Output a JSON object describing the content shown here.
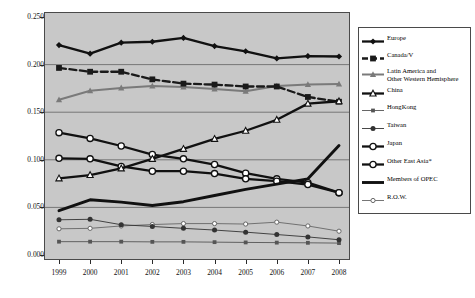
{
  "chart_data": {
    "type": "line",
    "title": "",
    "xlabel": "",
    "ylabel": "",
    "x": [
      1999,
      2000,
      2001,
      2002,
      2003,
      2004,
      2005,
      2006,
      2007,
      2008
    ],
    "xtick_labels": [
      "1999",
      "2000",
      "2001",
      "2002",
      "2003",
      "2004",
      "2005",
      "2006",
      "2007",
      "2008"
    ],
    "ytick_labels": [
      "0.250",
      "0.200",
      "0.150",
      "0.100",
      "0.050",
      "0.000"
    ],
    "ytick_values": [
      0.25,
      0.2,
      0.15,
      0.1,
      0.05,
      0.0
    ],
    "ylim": [
      0.0,
      0.25
    ],
    "xlim": [
      1999,
      2008
    ],
    "grid": "horizontal",
    "legend_position": "right",
    "plot_background": "#c8c8c8",
    "series": [
      {
        "name": "Europe",
        "marker": "diamond",
        "color": "#111111",
        "style": "solid",
        "values": [
          0.2205,
          0.2115,
          0.223,
          0.224,
          0.228,
          0.2195,
          0.214,
          0.2065,
          0.209,
          0.2085
        ]
      },
      {
        "name": "Canada/V",
        "marker": "square",
        "color": "#1a1a1a",
        "style": "dashed",
        "values": [
          0.1965,
          0.1925,
          0.1925,
          0.1845,
          0.18,
          0.179,
          0.177,
          0.177,
          0.166,
          0.161
        ]
      },
      {
        "name": "Latin America and\nOther Western Hemisphere",
        "marker": "triangle",
        "color": "#7a7a7a",
        "style": "solid",
        "values": [
          0.163,
          0.1725,
          0.1755,
          0.1775,
          0.1765,
          0.1745,
          0.172,
          0.1775,
          0.179,
          0.1795
        ]
      },
      {
        "name": "China",
        "marker": "triangle-open",
        "color": "#111111",
        "style": "solid",
        "values": [
          0.0805,
          0.084,
          0.091,
          0.101,
          0.1115,
          0.122,
          0.1305,
          0.142,
          0.159,
          0.1615
        ]
      },
      {
        "name": "HongKong",
        "marker": "square-small",
        "color": "#555555",
        "style": "solid",
        "values": [
          0.014,
          0.014,
          0.014,
          0.0138,
          0.0138,
          0.0135,
          0.0132,
          0.013,
          0.0128,
          0.0125
        ]
      },
      {
        "name": "Taiwan",
        "marker": "circle-filled",
        "color": "#333333",
        "style": "solid",
        "values": [
          0.037,
          0.0375,
          0.0318,
          0.03,
          0.028,
          0.0262,
          0.024,
          0.0215,
          0.019,
          0.016
        ]
      },
      {
        "name": "Japan",
        "marker": "circle-open",
        "color": "#111111",
        "style": "solid",
        "values": [
          0.1285,
          0.1225,
          0.1145,
          0.1055,
          0.101,
          0.095,
          0.086,
          0.08,
          0.076,
          0.0655
        ]
      },
      {
        "name": "Other East Asia*",
        "marker": "circle-open",
        "color": "#111111",
        "style": "solid",
        "values": [
          0.1015,
          0.101,
          0.093,
          0.088,
          0.088,
          0.0855,
          0.08,
          0.0775,
          0.074,
          0.0655
        ]
      },
      {
        "name": "Members of OPEC",
        "marker": "none",
        "color": "#111111",
        "style": "solid-thick",
        "values": [
          0.0465,
          0.058,
          0.0555,
          0.052,
          0.056,
          0.0625,
          0.069,
          0.0745,
          0.08,
          0.115
        ]
      },
      {
        "name": "R.O.W.",
        "marker": "circle-open-small",
        "color": "#666666",
        "style": "solid",
        "values": [
          0.0275,
          0.028,
          0.0305,
          0.032,
          0.033,
          0.033,
          0.0325,
          0.0345,
          0.0305,
          0.025
        ]
      }
    ]
  }
}
